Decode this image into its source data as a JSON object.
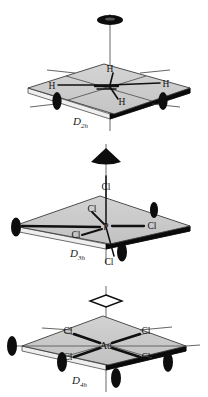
{
  "figure": {
    "kind": "molecular-symmetry-diagrams",
    "panel_count": 3,
    "colors": {
      "plane_fill": "#c8c8c8",
      "plane_fill_light": "#d2d2d2",
      "plane_edge": "#3a3a3a",
      "plane_edge_bold": "#000000",
      "bond": "#111111",
      "axis_line": "#6b6b6b",
      "symbol_fill": "#0d0d0d",
      "symbol_open_fill": "#ffffff",
      "text": "#111111",
      "background": "#ffffff"
    }
  },
  "panels": [
    {
      "id": "d2h",
      "point_group": "D",
      "point_group_sub": "2h",
      "point_group_label": "D2h",
      "center_label": "",
      "principal_axis_symbol": "filled-ellipse-c2",
      "principal_axis_order": 2,
      "in_plane_axis_symbols": [
        "filled-ellipse-c2",
        "filled-ellipse-c2"
      ],
      "ligands": [
        {
          "label": "H",
          "position": "top-center"
        },
        {
          "label": "H",
          "position": "left"
        },
        {
          "label": "H",
          "position": "right"
        },
        {
          "label": "H",
          "position": "bottom-center"
        }
      ],
      "ligand_count": 4
    },
    {
      "id": "d3h",
      "point_group": "D",
      "point_group_sub": "3h",
      "point_group_label": "D3h",
      "center_label": "P",
      "principal_axis_symbol": "filled-triangle-c3",
      "principal_axis_order": 3,
      "in_plane_axis_symbols": [
        "filled-ellipse-c2",
        "filled-ellipse-c2",
        "filled-ellipse-c2"
      ],
      "ligands": [
        {
          "label": "Cl",
          "position": "axial-top"
        },
        {
          "label": "Cl",
          "position": "equatorial-upper"
        },
        {
          "label": "Cl",
          "position": "equatorial-right"
        },
        {
          "label": "Cl",
          "position": "equatorial-lower-left"
        },
        {
          "label": "Cl",
          "position": "axial-bottom"
        }
      ],
      "ligand_count": 5
    },
    {
      "id": "d4h",
      "point_group": "D",
      "point_group_sub": "4h",
      "point_group_label": "D4h",
      "center_label": "Au",
      "principal_axis_symbol": "open-diamond-c4",
      "principal_axis_order": 4,
      "in_plane_axis_symbols": [
        "filled-ellipse-c2",
        "filled-ellipse-c2",
        "filled-ellipse-c2",
        "filled-ellipse-c2"
      ],
      "ligands": [
        {
          "label": "Cl",
          "position": "upper-left"
        },
        {
          "label": "Cl",
          "position": "upper-right"
        },
        {
          "label": "Cl",
          "position": "lower-left"
        },
        {
          "label": "Cl",
          "position": "lower-right"
        }
      ],
      "ligand_count": 4
    }
  ]
}
